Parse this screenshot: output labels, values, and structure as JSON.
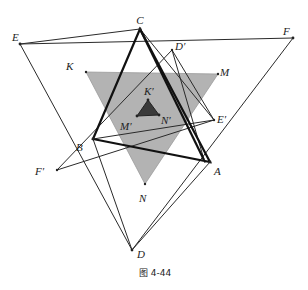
{
  "figure": {
    "caption": "图 4-44",
    "colors": {
      "shaded_triangle": "#b3b3b3",
      "inner_triangle": "#3a3a3a",
      "lines": "#222222"
    },
    "points": [
      {
        "id": "C",
        "label": "C"
      },
      {
        "id": "E",
        "label": "E"
      },
      {
        "id": "F",
        "label": "F"
      },
      {
        "id": "D",
        "label": "D"
      },
      {
        "id": "B",
        "label": "B"
      },
      {
        "id": "A",
        "label": "A"
      },
      {
        "id": "K",
        "label": "K"
      },
      {
        "id": "M",
        "label": "M"
      },
      {
        "id": "N",
        "label": "N"
      },
      {
        "id": "Dp",
        "label": "D′"
      },
      {
        "id": "Ep",
        "label": "E′"
      },
      {
        "id": "Fp",
        "label": "F′"
      },
      {
        "id": "Kp",
        "label": "K′"
      },
      {
        "id": "Mp",
        "label": "M′"
      },
      {
        "id": "Np",
        "label": "N′"
      }
    ],
    "triangles": [
      {
        "name": "EFD",
        "vertices": [
          "E",
          "F",
          "D"
        ],
        "style": "thin"
      },
      {
        "name": "ABC",
        "vertices": [
          "A",
          "B",
          "C"
        ],
        "style": "thick"
      },
      {
        "name": "KMN",
        "vertices": [
          "K",
          "M",
          "N"
        ],
        "style": "shaded"
      },
      {
        "name": "D'E'F'",
        "vertices": [
          "Dp",
          "Ep",
          "Fp"
        ],
        "style": "thin"
      },
      {
        "name": "K'M'N'",
        "vertices": [
          "Kp",
          "Mp",
          "Np"
        ],
        "style": "dark-filled"
      }
    ]
  }
}
